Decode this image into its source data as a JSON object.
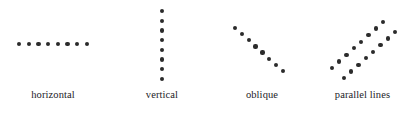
{
  "figure": {
    "width": 415,
    "height": 114,
    "background": "#ffffff",
    "dot_color": "#2b2b2b",
    "dot_diameter": 4.2,
    "label_color": "#23211f"
  },
  "panels": [
    {
      "key": "horizontal",
      "label": "horizontal",
      "dot_count": 8,
      "start": {
        "x": 19,
        "y": 44
      },
      "end": {
        "x": 87,
        "y": 44
      },
      "lines": [
        {
          "start": {
            "x": 19,
            "y": 44
          },
          "end": {
            "x": 87,
            "y": 44
          },
          "count": 8
        }
      ]
    },
    {
      "key": "vertical",
      "label": "vertical",
      "dot_count": 8,
      "start": {
        "x": 162,
        "y": 11
      },
      "end": {
        "x": 162,
        "y": 79
      },
      "lines": [
        {
          "start": {
            "x": 162,
            "y": 11
          },
          "end": {
            "x": 162,
            "y": 79
          },
          "count": 8
        }
      ]
    },
    {
      "key": "oblique",
      "label": "oblique",
      "dot_count": 8,
      "start": {
        "x": 235,
        "y": 28
      },
      "end": {
        "x": 283,
        "y": 71
      },
      "lines": [
        {
          "start": {
            "x": 235,
            "y": 28
          },
          "end": {
            "x": 283,
            "y": 71
          },
          "count": 8
        }
      ]
    },
    {
      "key": "parallel-lines",
      "label": "parallel lines",
      "dot_count": 16,
      "lines": [
        {
          "start": {
            "x": 332,
            "y": 68
          },
          "end": {
            "x": 383,
            "y": 22
          },
          "count": 8
        },
        {
          "start": {
            "x": 344,
            "y": 78
          },
          "end": {
            "x": 395,
            "y": 32
          },
          "count": 8
        }
      ]
    }
  ],
  "captions": {
    "horizontal": "horizontal",
    "vertical": "vertical",
    "oblique": "oblique",
    "parallel_lines": "parallel lines"
  }
}
